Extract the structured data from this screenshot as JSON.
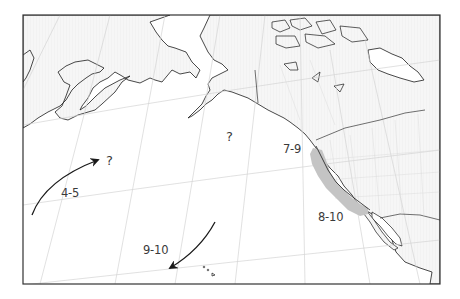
{
  "map": {
    "region": "North Pacific / western North America",
    "colors": {
      "frame": "#333333",
      "coastline": "#1a1a1a",
      "land_fill": "#f4f4f4",
      "ocean_fill": "#ffffff",
      "graticule": "#cfcfcf",
      "shaded_zone": "#c4c4c4",
      "arrow": "#1a1a1a",
      "text": "#3a3a3a"
    },
    "labels": {
      "unknown_gulf_of_alaska": "?",
      "unknown_north_pacific": "?",
      "route_west_months": "4-5",
      "pacific_northwest_months": "7-9",
      "california_coast_months": "8-10",
      "route_south_months": "9-10"
    },
    "arrows": [
      {
        "name": "northeast-route-arrow",
        "label": "4-5",
        "direction": "northeast"
      },
      {
        "name": "southwest-route-arrow",
        "label": "9-10",
        "direction": "southwest"
      }
    ],
    "shaded_areas": [
      {
        "name": "california-coast-zone",
        "label_range": "7-9 to 8-10"
      }
    ]
  }
}
